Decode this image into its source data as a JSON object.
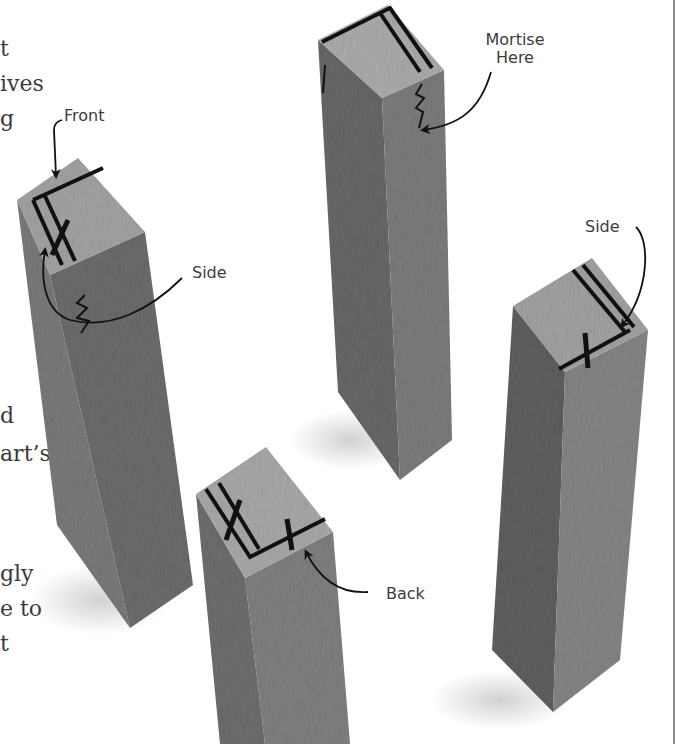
{
  "page": {
    "left_column_fragments": [
      {
        "text": "t",
        "x": 0,
        "y": 38
      },
      {
        "text": "ives",
        "x": 0,
        "y": 73
      },
      {
        "text": "g",
        "x": 0,
        "y": 108
      },
      {
        "text": "d",
        "x": 0,
        "y": 405
      },
      {
        "text": "art’s",
        "x": 0,
        "y": 443
      },
      {
        "text": "gly",
        "x": 0,
        "y": 563
      },
      {
        "text": "e to",
        "x": 0,
        "y": 598
      },
      {
        "text": "t",
        "x": 0,
        "y": 633
      }
    ]
  },
  "figure": {
    "labels": {
      "front": "Front",
      "side_left": "Side",
      "mortise_line1": "Mortise",
      "mortise_line2": "Here",
      "side_right": "Side",
      "back": "Back"
    },
    "colors": {
      "wood_light": "#a9a9a9",
      "wood_mid": "#7d7d7d",
      "wood_dark": "#5e5e5e",
      "mark": "#111111"
    }
  }
}
